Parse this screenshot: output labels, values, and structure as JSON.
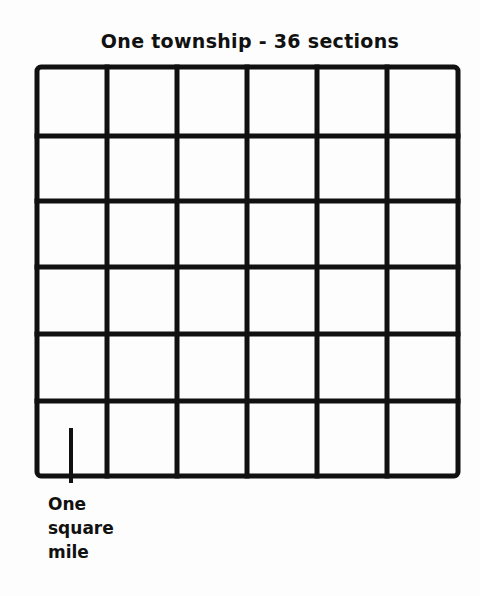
{
  "diagram": {
    "title": "One township - 36 sections",
    "grid": {
      "rows": 6,
      "columns": 6,
      "total_sections": 36
    },
    "pointer_label": {
      "line1": "One",
      "line2": "square",
      "line3": "mile"
    },
    "colors": {
      "line": "#111111",
      "background": "#fdfdfd"
    }
  }
}
